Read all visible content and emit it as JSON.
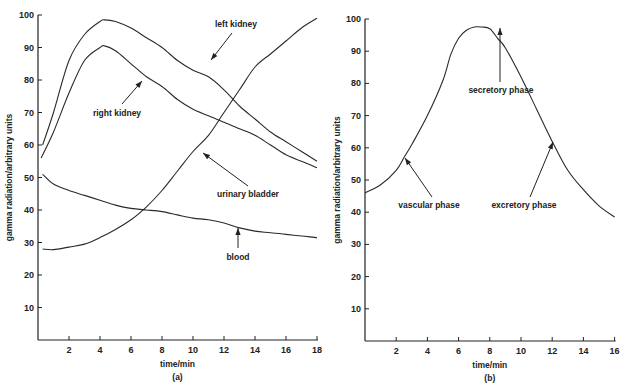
{
  "chart_data": [
    {
      "id": "a",
      "type": "line",
      "panel_label": "(a)",
      "title": "",
      "xlabel": "time/min",
      "ylabel": "gamma radiation/arbitrary units",
      "xlim": [
        0,
        18
      ],
      "ylim": [
        0,
        100
      ],
      "xticks": [
        2,
        4,
        6,
        8,
        10,
        12,
        14,
        16,
        18
      ],
      "yticks": [
        10,
        20,
        30,
        40,
        50,
        60,
        70,
        80,
        90,
        100
      ],
      "grid": false,
      "legend": "none (curves labeled with arrows)",
      "series": [
        {
          "name": "left kidney",
          "x": [
            0.3,
            1,
            2,
            3,
            4,
            4.3,
            5,
            6,
            7,
            8,
            9,
            10,
            11,
            12,
            13,
            14,
            15,
            16,
            17,
            18
          ],
          "y": [
            60,
            70,
            86,
            94,
            98,
            98.5,
            98,
            96,
            93,
            90,
            86,
            83,
            81,
            77,
            72,
            68,
            64,
            61,
            58,
            55
          ]
        },
        {
          "name": "right kidney",
          "x": [
            0.2,
            1,
            2,
            3,
            4,
            4.3,
            5,
            6,
            7,
            8,
            9,
            10,
            11,
            12,
            13,
            14,
            15,
            16,
            17,
            18
          ],
          "y": [
            56,
            64,
            76,
            86,
            90,
            90.5,
            89,
            85,
            81,
            78,
            74,
            71,
            69,
            67,
            65,
            63,
            60,
            57,
            55,
            53
          ]
        },
        {
          "name": "urinary bladder",
          "x": [
            0.3,
            1,
            2,
            3,
            4,
            5,
            6,
            7,
            8,
            9,
            10,
            11,
            12,
            13,
            14,
            15,
            16,
            17,
            18
          ],
          "y": [
            28,
            27.8,
            28.6,
            29.5,
            31.5,
            34,
            37,
            41,
            46,
            52,
            58,
            63,
            70,
            77,
            84,
            88,
            92,
            96,
            99
          ]
        },
        {
          "name": "blood",
          "x": [
            0.3,
            1,
            2,
            3,
            4,
            5,
            6,
            7,
            8,
            9,
            10,
            11,
            12,
            13,
            14,
            15,
            16,
            17,
            18
          ],
          "y": [
            51,
            48,
            46,
            44.5,
            43,
            41.5,
            40.5,
            40,
            39.5,
            38.5,
            37.5,
            37,
            36,
            34.5,
            33.5,
            33,
            32.5,
            32,
            31.5
          ]
        }
      ],
      "annotations": [
        {
          "text": "left kidney",
          "target_series": "left kidney",
          "arrow_to": [
            9.5,
            86
          ]
        },
        {
          "text": "right kidney",
          "target_series": "right kidney",
          "arrow_to": [
            7,
            81
          ]
        },
        {
          "text": "urinary bladder",
          "target_series": "urinary bladder",
          "arrow_to": [
            10.5,
            61
          ]
        },
        {
          "text": "blood",
          "target_series": "blood",
          "arrow_to": [
            12.8,
            34.5
          ]
        }
      ]
    },
    {
      "id": "b",
      "type": "line",
      "panel_label": "(b)",
      "title": "",
      "xlabel": "time/min",
      "ylabel": "gamma radiation/arbitrary units",
      "xlim": [
        0,
        16
      ],
      "ylim": [
        0,
        100
      ],
      "xticks": [
        2,
        4,
        6,
        8,
        10,
        12,
        14,
        16
      ],
      "yticks": [
        10,
        20,
        30,
        40,
        50,
        60,
        70,
        80,
        90,
        100
      ],
      "grid": false,
      "legend": "none (phases labeled with arrows)",
      "series": [
        {
          "name": "renogram",
          "x": [
            0,
            1,
            2,
            2.5,
            3,
            4,
            5,
            5.5,
            6,
            6.5,
            7,
            7.5,
            8,
            8.5,
            9,
            10,
            11,
            12,
            13,
            14,
            15,
            16
          ],
          "y": [
            46,
            48.5,
            53,
            57,
            61,
            70,
            81,
            89,
            94,
            96.5,
            97.5,
            97.5,
            97,
            94,
            91,
            82,
            72,
            62,
            53,
            47,
            42,
            38.5
          ]
        }
      ],
      "annotations": [
        {
          "text": "secretory phase",
          "arrow_to": [
            7.3,
            97.5
          ]
        },
        {
          "text": "vascular phase",
          "arrow_to": [
            2.5,
            57
          ]
        },
        {
          "text": "excretory phase",
          "arrow_to": [
            12.1,
            62
          ]
        }
      ]
    }
  ]
}
